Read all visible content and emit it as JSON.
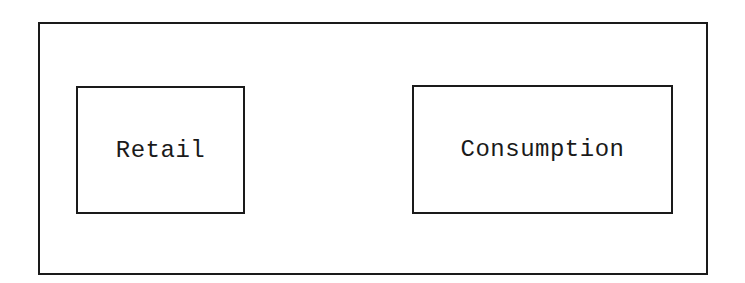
{
  "diagram": {
    "nodes": [
      {
        "id": "retail",
        "label": "Retail"
      },
      {
        "id": "consumption",
        "label": "Consumption"
      }
    ],
    "colors": {
      "stroke": "#1a1a1a",
      "background": "#ffffff"
    }
  }
}
